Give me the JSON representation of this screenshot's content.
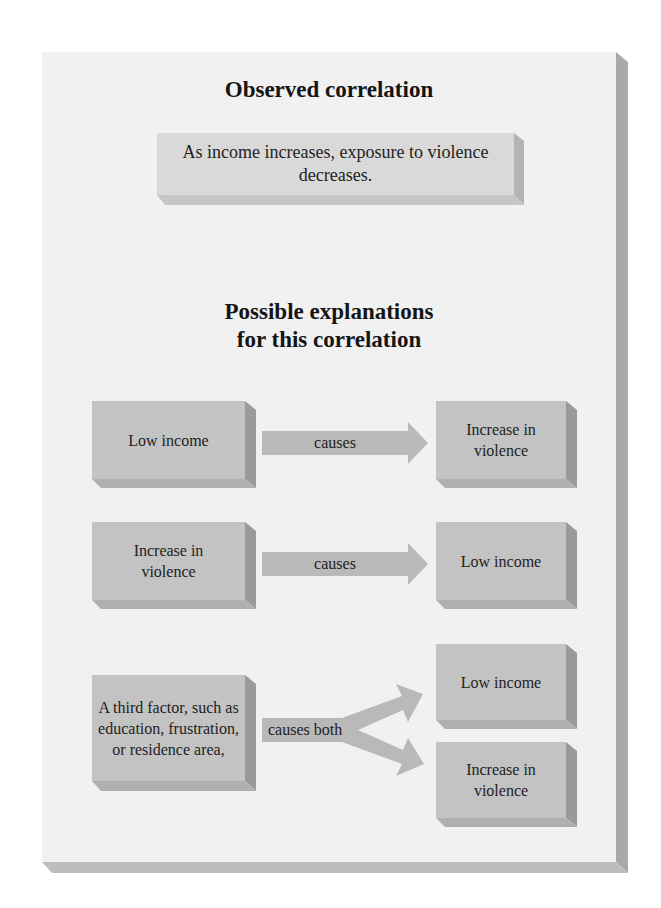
{
  "observed": {
    "heading": "Observed correlation",
    "statement": "As income increases, exposure to violence decreases."
  },
  "explanations": {
    "heading_line1": "Possible explanations",
    "heading_line2": "for this correlation",
    "rows": [
      {
        "cause": "Low income",
        "arrow_label": "causes",
        "effect": "Increase in violence"
      },
      {
        "cause": "Increase in violence",
        "arrow_label": "causes",
        "effect": "Low income"
      },
      {
        "cause": "A third factor, such as education, frustration, or residence area,",
        "arrow_label": "causes both",
        "effects": [
          "Low income",
          "Increase in violence"
        ]
      }
    ]
  },
  "colors": {
    "panel": "#f1f1f1",
    "box_face": "#c3c3c3",
    "box_side": "#9a9a9a",
    "arrow": "#b9b9b9",
    "text": "#1a1a1a"
  }
}
